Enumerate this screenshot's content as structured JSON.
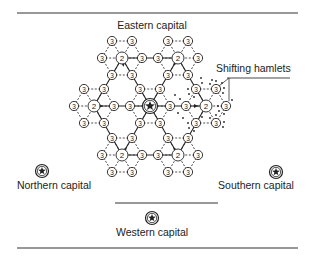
{
  "labels": {
    "eastern": "Eastern capital",
    "northern": "Northern capital",
    "southern": "Southern capital",
    "western": "Western capital",
    "shifting": "Shifting hamlets"
  },
  "legend_values": {
    "tier2": "2",
    "tier3": "3"
  },
  "colors": {
    "ink": "#222222",
    "background": "#ffffff"
  },
  "clusters": [
    {
      "name": "top-left",
      "center": [
        122,
        58
      ],
      "center_type": "2",
      "arrow_to": [
        131,
        106
      ]
    },
    {
      "name": "top-right",
      "center": [
        178,
        58
      ],
      "center_type": "2",
      "arrow_to": [
        160,
        89
      ]
    },
    {
      "name": "left",
      "center": [
        94,
        106
      ],
      "center_type": "2",
      "arrow_to": [
        131,
        106
      ]
    },
    {
      "name": "center",
      "center": [
        150,
        106
      ],
      "center_type": "star"
    },
    {
      "name": "right-shifting",
      "center": [
        206,
        106
      ],
      "center_type": "2",
      "shifting": true
    },
    {
      "name": "bottom-left",
      "center": [
        122,
        155
      ],
      "center_type": "2",
      "arrow_to": [
        140,
        123
      ]
    },
    {
      "name": "bottom-right",
      "center": [
        178,
        155
      ],
      "center_type": "2",
      "arrow_to": [
        160,
        123
      ]
    }
  ],
  "capitals": [
    {
      "name": "northern",
      "x": 42,
      "y": 171
    },
    {
      "name": "southern",
      "x": 276,
      "y": 172
    },
    {
      "name": "western",
      "x": 152,
      "y": 218
    }
  ]
}
